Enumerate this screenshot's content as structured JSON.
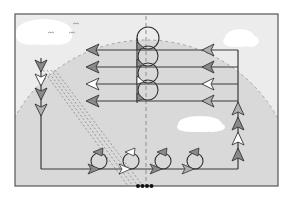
{
  "diagram": {
    "title": "",
    "colors": {
      "background": "#ffffff",
      "field": "#d9d9d9",
      "sky": "#ececec",
      "frame": "#555555",
      "line": "#3a3a3a",
      "dashed": "#9a9a9a",
      "cloud": "#ffffff",
      "arrow_gray": "#8a8a8a",
      "arrow_white": "#ffffff",
      "dots": "#111111"
    },
    "frame": {
      "x": 15,
      "y": 14,
      "width": 263,
      "height": 172
    },
    "horizontal_lanes": [
      {
        "y": 50,
        "left_arrow": "gray",
        "right_arrow": "gray"
      },
      {
        "y": 67,
        "left_arrow": "gray",
        "right_arrow": "gray"
      },
      {
        "y": 84,
        "left_arrow": "white",
        "right_arrow": "white"
      },
      {
        "y": 101,
        "left_arrow": "gray",
        "right_arrow": "gray"
      }
    ],
    "center_loops": 4,
    "left_column_arrows": [
      "gray",
      "white",
      "gray",
      "gray"
    ],
    "right_column_arrows": [
      "gray",
      "gray",
      "white",
      "gray"
    ],
    "bottom_loops": [
      "gray",
      "white",
      "gray",
      "gray"
    ],
    "clouds": 3,
    "birds": 3,
    "bottom_dots": 4
  }
}
